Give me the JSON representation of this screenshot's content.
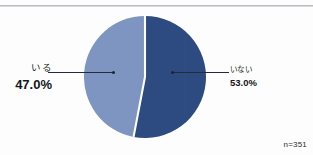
{
  "chart_data": {
    "type": "pie",
    "title": "",
    "subtitle": "",
    "xlabel": "",
    "ylabel": "",
    "legend_position": "none",
    "grid": false,
    "categories": [
      "いる",
      "いない"
    ],
    "values": [
      47.0,
      53.0
    ],
    "value_labels": [
      "47.0%",
      "53.0%"
    ],
    "units": "%",
    "total": 100.0,
    "sample_size_label": "n=351",
    "sample_size": 351,
    "start_angle_deg": 0,
    "direction": "clockwise",
    "series": [
      {
        "name": "回答割合",
        "values": [
          47.0,
          53.0
        ]
      }
    ],
    "slices": [
      {
        "label": "いる",
        "value": 47.0,
        "value_label": "47.0%",
        "color": "#7d95c0",
        "side": "left"
      },
      {
        "label": "いない",
        "value": 53.0,
        "value_label": "53.0%",
        "color": "#2d4b80",
        "side": "right"
      }
    ]
  },
  "colors": {
    "slice_light": "#7d95c0",
    "slice_dark": "#2d4b80",
    "slice_divider": "#ffffff",
    "leader_line": "#262b3a",
    "text": "#14161b",
    "top_rule": "#b9bcc0",
    "background": "#fdfdfd"
  },
  "labels": {
    "left": {
      "name": "いる",
      "value": "47.0%"
    },
    "right": {
      "name": "いない",
      "value": "53.0%"
    }
  },
  "footnote": {
    "sample": "n=351"
  }
}
